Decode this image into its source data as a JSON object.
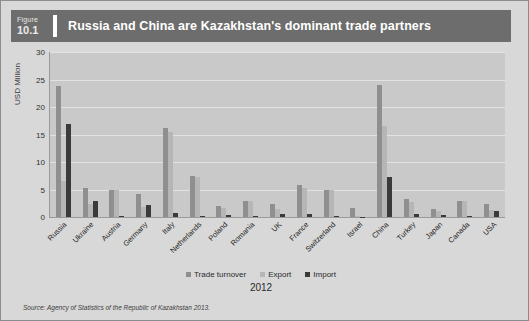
{
  "figure": {
    "label_small": "Figure",
    "number": "10.1",
    "title": "Russia and China are Kazakhstan's dominant trade partners",
    "source": "Source: Agency of Statistics of the Republic of Kazakhstan 2013.",
    "header_bg": "#6d6d6d",
    "panel_bg": "#d8d8d8",
    "plot_bg": "#c9c9c9"
  },
  "chart_data": {
    "type": "bar",
    "title": "Russia and China are Kazakhstan's dominant trade partners",
    "xlabel": "2012",
    "ylabel": "USD Million",
    "ylim": [
      0,
      30
    ],
    "yticks": [
      0,
      5,
      10,
      15,
      20,
      25,
      30
    ],
    "grid": true,
    "legend_position": "bottom",
    "categories": [
      "Russia",
      "Ukraine",
      "Austria",
      "Germany",
      "Italy",
      "Netherlands",
      "Poland",
      "Romania",
      "UK",
      "France",
      "Switzerland",
      "Israel",
      "China",
      "Turkey",
      "Japan",
      "Canada",
      "USA"
    ],
    "series": [
      {
        "name": "Trade turnover",
        "color": "#8f8f8f",
        "values": [
          23.8,
          5.3,
          5.0,
          4.1,
          16.2,
          7.5,
          2.0,
          3.0,
          2.3,
          5.9,
          5.0,
          1.7,
          24.0,
          3.3,
          1.5,
          3.0,
          2.4
        ]
      },
      {
        "name": "Export",
        "color": "#b6b6b6",
        "values": [
          6.6,
          2.4,
          4.9,
          1.8,
          15.4,
          7.3,
          1.6,
          2.9,
          1.5,
          5.3,
          4.9,
          0.1,
          16.5,
          2.7,
          1.1,
          2.9,
          1.3
        ]
      },
      {
        "name": "Import",
        "color": "#3a3a3a",
        "values": [
          17.0,
          2.9,
          0.15,
          2.2,
          0.8,
          0.25,
          0.3,
          0.1,
          0.5,
          0.6,
          0.1,
          0.05,
          7.3,
          0.6,
          0.4,
          0.1,
          1.1
        ]
      }
    ]
  }
}
